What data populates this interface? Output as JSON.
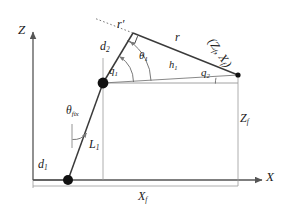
{
  "figure": {
    "kind": "kinematic-diagram",
    "title": "",
    "axes": {
      "z_label": "Z",
      "x_label": "X"
    },
    "links": {
      "l1_label": "L",
      "l1_sub": "1",
      "d1_label": "d",
      "d1_sub": "1",
      "d2_label": "d",
      "d2_sub": "2",
      "r_label": "r",
      "r_prime_label": "r′",
      "h1_label": "h",
      "h1_sub": "1"
    },
    "angles": {
      "theta_fix_label": "θ",
      "theta_fix_sub": "fix",
      "theta1_label": "θ",
      "theta1_sub": "1",
      "q1_label": "q",
      "q1_sub": "1",
      "q2_label": "q",
      "q2_sub": "2"
    },
    "dimensions": {
      "zf_label": "Z",
      "zf_sub": "f",
      "xf_label": "X",
      "xf_sub": "f"
    },
    "endpoint": {
      "coord_label": "(Z",
      "coord_sub1": "f",
      "coord_mid": ", X",
      "coord_sub2": "f",
      "coord_close": ")"
    },
    "colors": {
      "stroke": "#3a3a3a",
      "axis": "#555555",
      "thin": "#8a8a8a",
      "joint": "#111111",
      "text": "#1a1a1a"
    },
    "markers": {
      "right_angle": "right-angle-square",
      "base_joint": "filled-circle",
      "elbow_joint": "filled-circle",
      "end_point": "filled-circle"
    }
  }
}
